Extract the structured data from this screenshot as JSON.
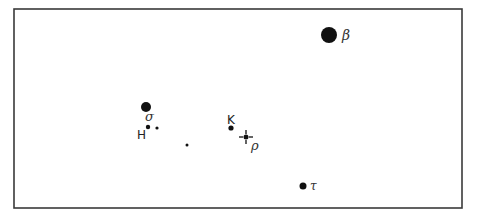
{
  "diagram": {
    "type": "star-chart",
    "frame": {
      "x": 14,
      "y": 9,
      "width": 448,
      "height": 199
    },
    "stars": [
      {
        "id": "beta",
        "label": "β",
        "cx": 329,
        "cy": 35,
        "r": 8,
        "label_x": 342,
        "label_y": 40,
        "label_style": "greek"
      },
      {
        "id": "sigma",
        "label": "σ",
        "cx": 146,
        "cy": 107,
        "r": 5,
        "label_x": 145,
        "label_y": 121,
        "label_style": "greek"
      },
      {
        "id": "H",
        "label": "H",
        "cx": 148,
        "cy": 127,
        "r": 2.2,
        "label_x": 137,
        "label_y": 139,
        "label_style": "latin"
      },
      {
        "id": "H-companion",
        "label": "",
        "cx": 157,
        "cy": 128,
        "r": 1.6
      },
      {
        "id": "unlabeled",
        "label": "",
        "cx": 187,
        "cy": 145,
        "r": 1.5
      },
      {
        "id": "K",
        "label": "K",
        "cx": 231,
        "cy": 128,
        "r": 2.6,
        "label_x": 227,
        "label_y": 124,
        "label_style": "latin"
      },
      {
        "id": "rho",
        "label": "ρ",
        "cx": 246,
        "cy": 137,
        "r": 2.5,
        "label_x": 251,
        "label_y": 150,
        "label_style": "greek",
        "marker": "crosshair"
      },
      {
        "id": "tau",
        "label": "τ",
        "cx": 303,
        "cy": 186,
        "r": 3.5,
        "label_x": 310,
        "label_y": 190,
        "label_style": "greek"
      }
    ],
    "colors": {
      "frame": "#3a3a3a",
      "star": "#111111",
      "label": "#333333",
      "background": "#ffffff"
    }
  }
}
